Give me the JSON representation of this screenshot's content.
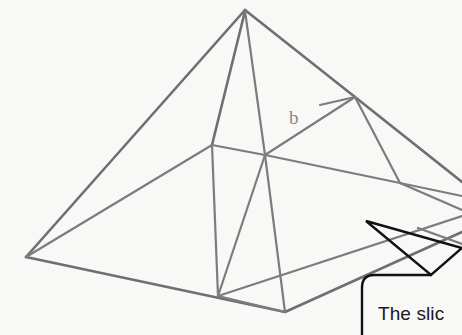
{
  "figure": {
    "name": "pyramid-slice-diagram",
    "background_color": "#f8f8f7",
    "edge_color": "#6f6f6f",
    "callout_color": "#111111"
  },
  "labels": {
    "base_edge_label": "b"
  },
  "callout": {
    "text": "The slic",
    "arrow_name": "slice-pointer-arrow",
    "arrow_direction": "up-left",
    "arrow_style": "outline"
  },
  "geometry": {
    "description": "Square-base pyramid drawn in oblique projection with an internal triangular slice plane; a detached wedge piece sits at the right edge.",
    "vertices": {
      "apex": [
        245,
        10
      ],
      "base_left": [
        26,
        257
      ],
      "base_front": [
        285,
        312
      ],
      "base_right_far": [
        462,
        195
      ],
      "base_back": [
        212,
        145
      ],
      "center_hub": [
        265,
        155
      ],
      "right_node": [
        400,
        183
      ],
      "upper_right_node": [
        355,
        97
      ],
      "front_left_node": [
        218,
        296
      ]
    }
  }
}
